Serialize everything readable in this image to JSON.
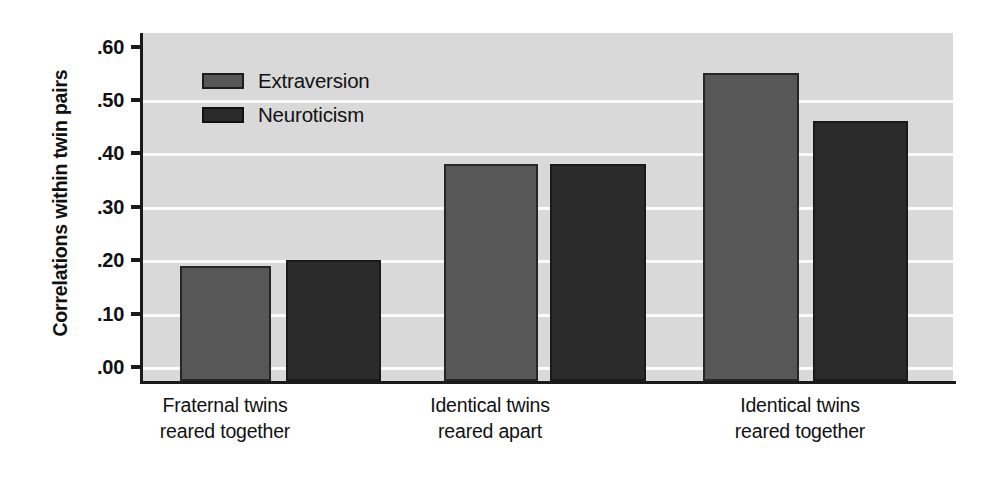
{
  "chart_data": {
    "type": "bar",
    "title": "",
    "xlabel": "",
    "ylabel": "Correlations within twin pairs",
    "categories": [
      "Fraternal twins reared together",
      "Identical twins reared apart",
      "Identical twins reared together"
    ],
    "category_lines": [
      [
        "Fraternal twins",
        "reared together"
      ],
      [
        "Identical twins",
        "reared apart"
      ],
      [
        "Identical twins",
        "reared together"
      ]
    ],
    "series": [
      {
        "name": "Extraversion",
        "color": "#575757",
        "values": [
          0.19,
          0.38,
          0.55
        ]
      },
      {
        "name": "Neuroticism",
        "color": "#2b2b2b",
        "values": [
          0.2,
          0.38,
          0.46
        ]
      }
    ],
    "ylim": [
      0.0,
      0.6
    ],
    "ytick_values": [
      0.6,
      0.5,
      0.4,
      0.3,
      0.2,
      0.1,
      0.0
    ],
    "ytick_labels": [
      ".60",
      ".50",
      ".40",
      ".30",
      ".20",
      ".10",
      ".00"
    ],
    "grid": true,
    "grid_color": "#fbfbfb",
    "plot_background": "#d9d9d9",
    "axis_color": "#1a1a1a",
    "legend_position": "top-left",
    "legend_entries": [
      "Extraversion",
      "Neuroticism"
    ]
  },
  "axis": {
    "y_title": "Correlations within twin pairs"
  },
  "legend": {
    "items": [
      {
        "label": "Extraversion"
      },
      {
        "label": "Neuroticism"
      }
    ]
  },
  "geometry": {
    "plot_left": 140,
    "plot_right": 953,
    "plot_top": 33,
    "baseline_y": 381,
    "y_zero_px": 367,
    "px_per_unit": 534.0,
    "bars": [
      {
        "series": "Extraversion",
        "group": 0,
        "x": 177,
        "width": 91,
        "value": 0.19
      },
      {
        "series": "Neuroticism",
        "group": 0,
        "x": 283,
        "width": 95,
        "value": 0.2
      },
      {
        "series": "Extraversion",
        "group": 1,
        "x": 441,
        "width": 94,
        "value": 0.38
      },
      {
        "series": "Neuroticism",
        "group": 1,
        "x": 547,
        "width": 96,
        "value": 0.38
      },
      {
        "series": "Extraversion",
        "group": 2,
        "x": 700,
        "width": 96,
        "value": 0.55
      },
      {
        "series": "Neuroticism",
        "group": 2,
        "x": 810,
        "width": 95,
        "value": 0.46
      }
    ],
    "group_label_centers": [
      225,
      490,
      800
    ]
  }
}
